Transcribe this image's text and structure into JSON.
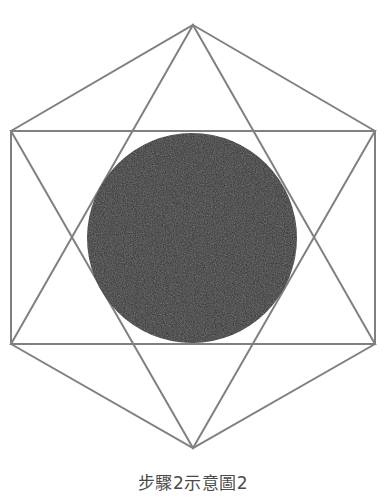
{
  "figure": {
    "caption": "步驟2示意圖2",
    "caption_color": "#4a4a4a",
    "background_color": "#ffffff",
    "stroke_color": "#808080",
    "stroke_width": 2,
    "circle_fill_color": "#2c2c2c",
    "shapes": {
      "hexagon": {
        "name": "outer-hexagon",
        "points": "193,25 375,131 375,344 193,448 11,344 11,131"
      },
      "triangle_up": {
        "name": "upward-triangle",
        "points": "193,25 375,344 11,344"
      },
      "triangle_down": {
        "name": "downward-triangle",
        "points": "193,448 11,131 375,131"
      },
      "circle": {
        "name": "inscribed-circle",
        "cx": 192,
        "cy": 238,
        "r": 105
      }
    }
  }
}
